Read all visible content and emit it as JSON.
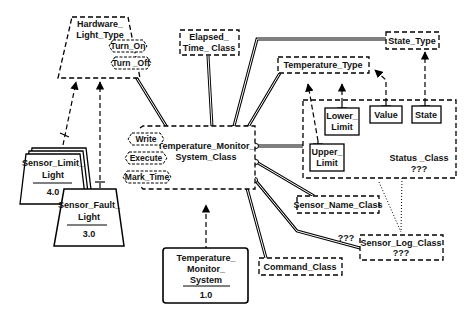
{
  "diagram": {
    "type": "Booch class/module diagram",
    "classes": {
      "hardware_light_type": {
        "line1": "Hardware_",
        "line2": "Light_Type",
        "kind": "abstract-class-category"
      },
      "elapsed_time_class": {
        "line1": "Elapsed_",
        "line2": "Time_ Class"
      },
      "state_type": {
        "label": "State_Type"
      },
      "temperature_type": {
        "label": "Temperature_Type"
      },
      "temperature_monitor_system_class": {
        "line1": "Temperature_Monitor_",
        "line2": "System_Class"
      },
      "status_class": {
        "line1": "Status _Class",
        "line2": "???"
      },
      "lower_limit": {
        "line1": "Lower_",
        "line2": "Limit"
      },
      "value": {
        "label": "Value"
      },
      "state": {
        "label": "State"
      },
      "upper_limit": {
        "line1": "Upper_",
        "line2": "Limit"
      },
      "sensor_name_class": {
        "label": "Sensor_Name_Class"
      },
      "sensor_log_class": {
        "line1": "Sensor_Log_Class",
        "line2": "???"
      },
      "command_class": {
        "label": "Command_Class"
      },
      "sensor_log_cardinality": "???"
    },
    "operations": {
      "hardware": [
        "Turn_On",
        "Turn _Off"
      ],
      "monitor": [
        "Write",
        "Execute",
        "Mark_Time"
      ]
    },
    "modules": {
      "sensor_limit_light": {
        "line1": "Sensor_Limit_",
        "line2": "Light",
        "version": "4.0"
      },
      "sensor_fault_light": {
        "line1": "Sensor_Fault_",
        "line2": "Light",
        "version": "3.0"
      },
      "temperature_monitor_system": {
        "line1": "Temperature_",
        "line2": "Monitor_",
        "line3": "System",
        "version": "1.0"
      }
    }
  }
}
